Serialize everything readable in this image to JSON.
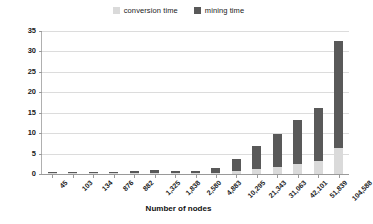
{
  "chart_data": {
    "type": "bar",
    "subtype": "stacked-column",
    "title": "",
    "xlabel": "Number of nodes",
    "ylabel": "Time (s)",
    "ylim": [
      0,
      35
    ],
    "yticks": [
      0,
      5,
      10,
      15,
      20,
      25,
      30,
      35
    ],
    "grid": true,
    "legend_position": "top-center",
    "categories": [
      "45",
      "103",
      "134",
      "876",
      "882",
      "1,325",
      "1,838",
      "2,580",
      "4,883",
      "10,295",
      "21,343",
      "31,063",
      "42,101",
      "51,839",
      "104,588"
    ],
    "series": [
      {
        "name": "conversion time",
        "color": "#DADADA",
        "values": [
          0.05,
          0.07,
          0.08,
          0.1,
          0.12,
          0.15,
          0.18,
          0.22,
          0.35,
          0.8,
          1.3,
          1.8,
          2.4,
          3.3,
          6.4
        ]
      },
      {
        "name": "mining time",
        "color": "#595959",
        "values": [
          0.15,
          0.18,
          0.32,
          0.35,
          0.43,
          0.8,
          0.52,
          0.48,
          1.05,
          2.8,
          5.6,
          8.0,
          10.8,
          12.9,
          26.1
        ]
      }
    ],
    "totals": [
      0.2,
      0.25,
      0.4,
      0.45,
      0.55,
      0.95,
      0.7,
      0.7,
      1.4,
      3.6,
      6.9,
      9.8,
      13.2,
      16.2,
      32.5
    ]
  },
  "legend": {
    "items": [
      {
        "label": "conversion time",
        "color": "#DADADA"
      },
      {
        "label": "mining time",
        "color": "#595959"
      }
    ]
  },
  "axes": {
    "y_title": "Time (s)",
    "x_title": "Number of nodes"
  },
  "colors": {
    "conversion": "#DADADA",
    "mining": "#595959",
    "grid": "#DCDCDC",
    "axis": "#9A9A9A",
    "text": "#1A1A1A",
    "background": "#FFFFFF"
  }
}
